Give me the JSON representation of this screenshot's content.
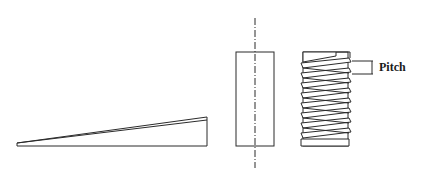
{
  "diagram": {
    "parts": [
      {
        "id": "inclined-plane",
        "description": "Wedge / inclined plane"
      },
      {
        "id": "cylinder",
        "description": "Cylinder with center axis"
      },
      {
        "id": "screw",
        "description": "Screw thread (inclined plane wrapped around cylinder)"
      }
    ],
    "annotations": {
      "pitch_label": "Pitch"
    },
    "colors": {
      "line": "#2b2b2b",
      "background": "#ffffff"
    }
  }
}
